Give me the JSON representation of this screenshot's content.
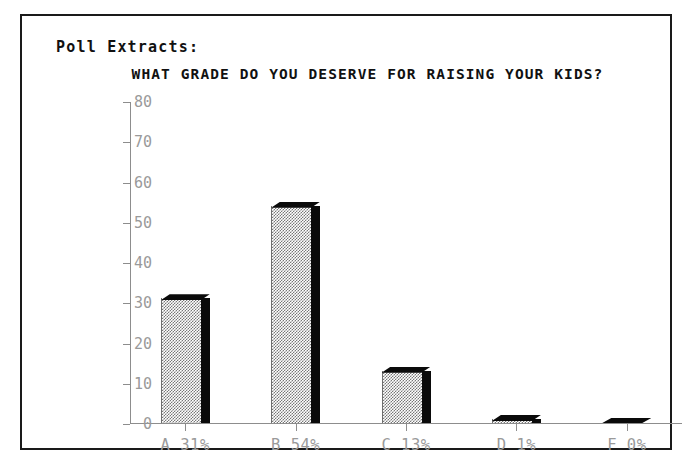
{
  "panel": {
    "header": "Poll Extracts:"
  },
  "chart_data": {
    "type": "bar",
    "title": "WHAT GRADE DO YOU DESERVE FOR RAISING YOUR KIDS?",
    "xlabel": "",
    "ylabel": "",
    "ylim": [
      0,
      80
    ],
    "yticks": [
      0,
      10,
      20,
      30,
      40,
      50,
      60,
      70,
      80
    ],
    "ytick_labels": [
      "0",
      "10",
      "20",
      "30",
      "40",
      "50",
      "60",
      "70",
      "80"
    ],
    "grid": false,
    "legend": null,
    "categories": [
      "A",
      "B",
      "C",
      "D",
      "F"
    ],
    "tick_labels": [
      "A 31%",
      "B 54%",
      "C 13%",
      "D 1%",
      "F 0%"
    ],
    "values": [
      31,
      54,
      13,
      1,
      0
    ],
    "percent_labels": [
      "31%",
      "54%",
      "13%",
      "1%",
      "0%"
    ],
    "style": {
      "bar_fill": "#808080",
      "bar_edge": "#000000",
      "axis_color": "#8d8d8d",
      "tick_label_color": "#9a9a9a",
      "title_color": "#111111",
      "background": "#ffffff",
      "frame_color": "#1a1a1a",
      "three_d": true
    }
  }
}
